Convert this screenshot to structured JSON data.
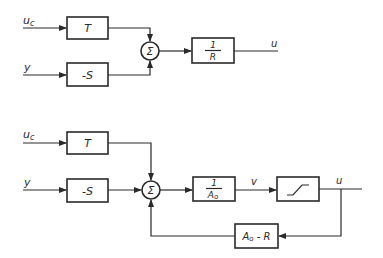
{
  "diagram": {
    "top": {
      "inputs": [
        {
          "label": "u",
          "subscript": "c"
        },
        {
          "label": "y"
        }
      ],
      "blocks": {
        "t": "T",
        "s": "-S",
        "sum": "Σ",
        "r_num": "1",
        "r_den": "R"
      },
      "output": "u"
    },
    "bottom": {
      "inputs": [
        {
          "label": "u",
          "subscript": "c"
        },
        {
          "label": "y"
        }
      ],
      "blocks": {
        "t": "T",
        "s": "-S",
        "sum": "Σ",
        "a_num": "1",
        "a_den_main": "A",
        "a_den_sub": "o",
        "feedback_main": "A",
        "feedback_sub": "o",
        "feedback_rest": " - R"
      },
      "signal_v": "v",
      "output": "u",
      "saturation_icon": "saturation-curve-icon"
    },
    "colors": {
      "line": "#2a2a2a",
      "background": "#ffffff"
    }
  }
}
